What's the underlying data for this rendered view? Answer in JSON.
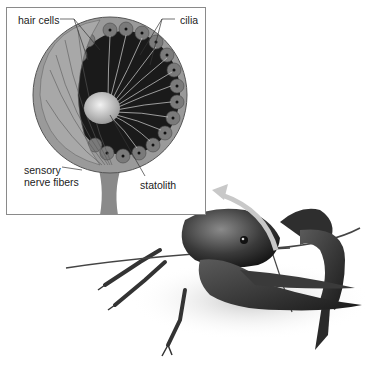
{
  "figure": {
    "inset": {
      "labels": {
        "hair_cells": "hair cells",
        "cilia": "cilia",
        "sensory_line1": "sensory",
        "sensory_line2": "nerve fibers",
        "statolith": "statolith"
      }
    },
    "colors": {
      "frame": "#8a8a8a",
      "arrow": "#c8c8c8",
      "organ_dark": "#1a1a1a",
      "organ_cells": "#7a7a7a",
      "statolith": "#d8d8d8"
    }
  }
}
